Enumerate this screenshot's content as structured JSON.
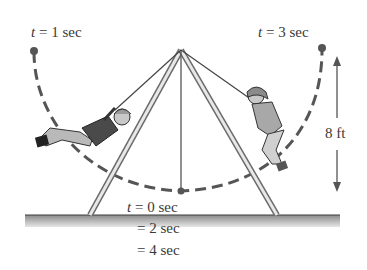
{
  "labels": {
    "t1_var": "t",
    "t1_rest": " = 1 sec",
    "t3_var": "t",
    "t3_rest": " = 3 sec",
    "t0_var": "t",
    "t0_rest": " = 0 sec",
    "t2": "= 2 sec",
    "t4": "= 4 sec",
    "height": "8 ft"
  },
  "colors": {
    "dot": "#555555",
    "arc": "#555555",
    "frame": "#6b6b6b",
    "ground_top": "#444444",
    "ground_fill": "#bdbdbd",
    "text": "#3a3a3a"
  },
  "diagram": {
    "positions": [
      {
        "time": "t = 1 sec",
        "location": "left extreme, top"
      },
      {
        "time": "t = 0, 2, 4 sec",
        "location": "bottom of arc"
      },
      {
        "time": "t = 3 sec",
        "location": "right extreme, top"
      }
    ],
    "vertical_dimension": "8 ft"
  }
}
